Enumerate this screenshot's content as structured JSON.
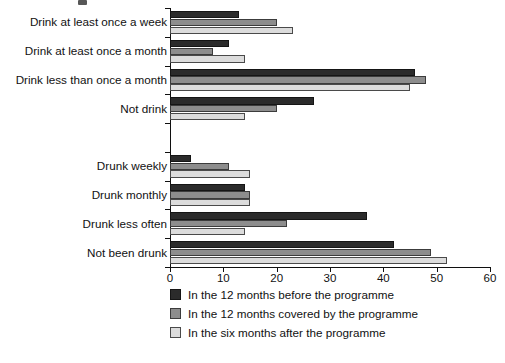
{
  "chart_data": {
    "type": "bar",
    "orientation": "horizontal",
    "title": "",
    "xlabel": "",
    "ylabel": "",
    "xlim": [
      0,
      60
    ],
    "xticks": [
      0,
      10,
      20,
      30,
      40,
      50,
      60
    ],
    "xtick_labels": [
      "0",
      "10",
      "20",
      "30",
      "40",
      "50",
      "60"
    ],
    "grid": false,
    "legend_position": "bottom",
    "categories": [
      "Drink at least once a week",
      "Drink at least once a month",
      "Drink less than once a month",
      "Not drink",
      "",
      "Drunk weekly",
      "Drunk monthly",
      "Drunk less often",
      "Not been drunk"
    ],
    "series": [
      {
        "name": "In the 12 months before the programme",
        "color": "#2b2b2b",
        "values": [
          13,
          11,
          46,
          27,
          null,
          4,
          14,
          37,
          42
        ]
      },
      {
        "name": "In the 12 months covered by the programme",
        "color": "#8d8d8d",
        "values": [
          20,
          8,
          48,
          20,
          null,
          11,
          15,
          22,
          49
        ]
      },
      {
        "name": "In the six months after the programme",
        "color": "#dcdcdc",
        "values": [
          23,
          14,
          45,
          14,
          null,
          15,
          15,
          14,
          52
        ]
      }
    ]
  },
  "legend": {
    "items": [
      {
        "label": "In the 12 months before the programme",
        "swatch": "s0"
      },
      {
        "label": "In the 12 months covered by the programme",
        "swatch": "s1"
      },
      {
        "label": "In the six months after the programme",
        "swatch": "s2"
      }
    ]
  }
}
